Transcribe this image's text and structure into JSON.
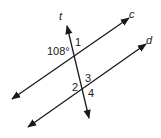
{
  "diagram": {
    "type": "parallel-lines-transversal",
    "lines": {
      "c": {
        "label": "c",
        "x1": 12,
        "y1": 99,
        "x2": 129,
        "y2": 18
      },
      "d": {
        "label": "d",
        "x1": 28,
        "y1": 127,
        "x2": 146,
        "y2": 44
      },
      "t": {
        "label": "t",
        "x1": 67,
        "y1": 26,
        "x2": 89,
        "y2": 118
      }
    },
    "labels": {
      "line_c": "c",
      "line_d": "d",
      "line_t": "t",
      "angle_given": "108°",
      "angle_1": "1",
      "angle_2": "2",
      "angle_3": "3",
      "angle_4": "4"
    },
    "color": "#1a1a1a"
  }
}
